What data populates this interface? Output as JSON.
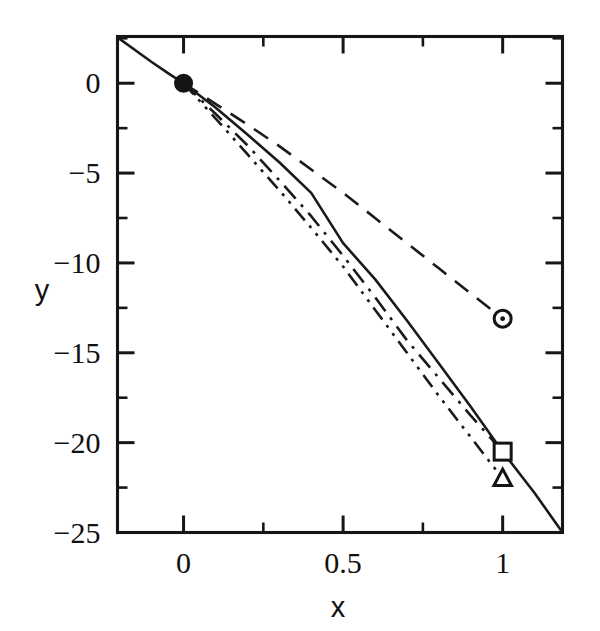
{
  "chart_data": {
    "type": "line",
    "title": "",
    "xlabel": "x",
    "ylabel": "y",
    "xlim": [
      -0.207,
      1.1875
    ],
    "ylim": [
      -25,
      2.6
    ],
    "grid": false,
    "legend": "none",
    "xticks": [
      0,
      0.5,
      1
    ],
    "xticklabels": [
      "0",
      "0.5",
      "1"
    ],
    "xminorticks": [
      0.25,
      0.75
    ],
    "yticks": [
      0,
      -5,
      -10,
      -15,
      -20,
      -25
    ],
    "yticklabels": [
      "0",
      "−5",
      "−10",
      "−15",
      "−20",
      "−25"
    ],
    "series": [
      {
        "name": "solid-curve",
        "style": "solid",
        "marker": "filled-circle-at-origin",
        "marker_point": [
          0,
          0
        ],
        "x": [
          -0.207,
          -0.15,
          -0.1,
          -0.05,
          0,
          0.1,
          0.2,
          0.3,
          0.4,
          0.5,
          0.6,
          0.7,
          0.8,
          0.9,
          1,
          1.1,
          1.1875
        ],
        "y": [
          2.55,
          1.82,
          1.18,
          0.58,
          0,
          -1.35,
          -2.85,
          -4.4,
          -6.1,
          -8.9,
          -10.9,
          -13.2,
          -15.6,
          -18.0,
          -20.5,
          -22.8,
          -25.0
        ]
      },
      {
        "name": "dashed-curve",
        "style": "dashed",
        "marker": "open-circle-with-dot",
        "marker_point": [
          1,
          -13.1
        ],
        "x": [
          0,
          0.1,
          0.2,
          0.3,
          0.4,
          0.5,
          0.6,
          0.7,
          0.8,
          0.9,
          1
        ],
        "y": [
          0,
          -1.15,
          -2.3,
          -3.5,
          -4.8,
          -6.1,
          -7.5,
          -8.9,
          -10.3,
          -11.7,
          -13.1
        ]
      },
      {
        "name": "dash-dot-curve",
        "style": "dash-dot",
        "marker": "open-square",
        "marker_point": [
          1,
          -20.5
        ],
        "x": [
          0,
          0.1,
          0.2,
          0.3,
          0.4,
          0.5,
          0.6,
          0.7,
          0.8,
          0.9,
          1
        ],
        "y": [
          0,
          -1.7,
          -3.45,
          -5.4,
          -7.4,
          -9.6,
          -11.9,
          -14.3,
          -16.4,
          -18.5,
          -20.5
        ]
      },
      {
        "name": "dash-dot-dot-curve",
        "style": "dash-dot-dot",
        "marker": "open-triangle",
        "marker_point": [
          1,
          -22.0
        ],
        "x": [
          0,
          0.1,
          0.2,
          0.3,
          0.4,
          0.5,
          0.6,
          0.7,
          0.8,
          0.9,
          1
        ],
        "y": [
          0,
          -1.95,
          -3.95,
          -5.95,
          -8.05,
          -10.2,
          -12.6,
          -15.0,
          -17.4,
          -19.7,
          -22.0
        ]
      }
    ],
    "markers": [
      {
        "name": "origin-point",
        "shape": "filled-circle",
        "x": 0,
        "y": 0
      },
      {
        "name": "dashed-endpoint",
        "shape": "circle-dot",
        "x": 1,
        "y": -13.1
      },
      {
        "name": "dash-dot-endpoint",
        "shape": "square",
        "x": 1,
        "y": -20.5
      },
      {
        "name": "dash-dot-dot-endpoint",
        "shape": "triangle",
        "x": 1,
        "y": -22.0
      }
    ],
    "colors": {
      "line": "#1a1a1a",
      "axis": "#161616",
      "background": "#ffffff"
    }
  }
}
